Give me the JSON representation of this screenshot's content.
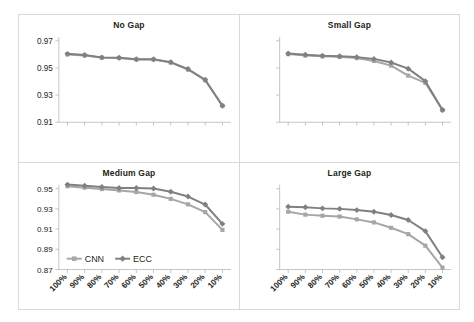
{
  "figure": {
    "background_color": "#ffffff",
    "border_color": "#d9d9d9"
  },
  "legend": {
    "position": "inside-bottom-left-of-medium-gap-panel",
    "entries": [
      {
        "label": "CNN",
        "color": "#a6a6a6",
        "marker": "square"
      },
      {
        "label": "ECC",
        "color": "#808080",
        "marker": "diamond"
      }
    ]
  },
  "axis": {
    "x_categories": [
      "100%",
      "90%",
      "80%",
      "70%",
      "60%",
      "50%",
      "40%",
      "30%",
      "20%",
      "10%"
    ],
    "x_label_rotation": -45,
    "top_y_ticks": [
      "0.91",
      "0.93",
      "0.95",
      "0.97"
    ],
    "bottom_y_ticks": [
      "0.87",
      "0.89",
      "0.91",
      "0.93",
      "0.95"
    ]
  },
  "chart_data": [
    {
      "type": "line",
      "title": "No Gap",
      "panel": "top-left",
      "xlabel": "",
      "ylabel": "",
      "categories": [
        "100%",
        "90%",
        "80%",
        "70%",
        "60%",
        "50%",
        "40%",
        "30%",
        "20%",
        "10%"
      ],
      "ylim": [
        0.91,
        0.97
      ],
      "yticks": [
        0.91,
        0.93,
        0.95,
        0.97
      ],
      "ytick_labels_visible": true,
      "grid": false,
      "series": [
        {
          "name": "CNN",
          "color": "#a6a6a6",
          "marker": "square",
          "values": [
            0.96,
            0.9592,
            0.9576,
            0.9574,
            0.9563,
            0.9562,
            0.954,
            0.9489,
            0.941,
            0.9222
          ]
        },
        {
          "name": "ECC",
          "color": "#808080",
          "marker": "diamond",
          "values": [
            0.9604,
            0.9595,
            0.9578,
            0.9576,
            0.9565,
            0.9564,
            0.9543,
            0.9492,
            0.9413,
            0.9222
          ]
        }
      ]
    },
    {
      "type": "line",
      "title": "Small Gap",
      "panel": "top-right",
      "xlabel": "",
      "ylabel": "",
      "categories": [
        "100%",
        "90%",
        "80%",
        "70%",
        "60%",
        "50%",
        "40%",
        "30%",
        "20%",
        "10%"
      ],
      "ylim": [
        0.91,
        0.97
      ],
      "yticks": [
        0.91,
        0.93,
        0.95,
        0.97
      ],
      "ytick_labels_visible": false,
      "grid": false,
      "series": [
        {
          "name": "CNN",
          "color": "#a6a6a6",
          "marker": "square",
          "values": [
            0.9602,
            0.9592,
            0.9586,
            0.9582,
            0.9573,
            0.9552,
            0.9517,
            0.9444,
            0.939,
            0.919
          ]
        },
        {
          "name": "ECC",
          "color": "#808080",
          "marker": "diamond",
          "values": [
            0.9607,
            0.9597,
            0.959,
            0.9586,
            0.958,
            0.9567,
            0.954,
            0.9495,
            0.9403,
            0.919
          ]
        }
      ]
    },
    {
      "type": "line",
      "title": "Medium Gap",
      "panel": "bottom-left",
      "xlabel": "",
      "ylabel": "",
      "categories": [
        "100%",
        "90%",
        "80%",
        "70%",
        "60%",
        "50%",
        "40%",
        "30%",
        "20%",
        "10%"
      ],
      "ylim": [
        0.87,
        0.95
      ],
      "yticks": [
        0.87,
        0.89,
        0.91,
        0.93,
        0.95
      ],
      "ytick_labels_visible": true,
      "grid": false,
      "series": [
        {
          "name": "CNN",
          "color": "#a6a6a6",
          "marker": "square",
          "values": [
            0.9524,
            0.951,
            0.9496,
            0.9482,
            0.9466,
            0.944,
            0.9399,
            0.9345,
            0.9268,
            0.9092
          ]
        },
        {
          "name": "ECC",
          "color": "#808080",
          "marker": "diamond",
          "values": [
            0.954,
            0.9528,
            0.9516,
            0.9506,
            0.9506,
            0.9502,
            0.947,
            0.9422,
            0.9343,
            0.9152
          ]
        }
      ]
    },
    {
      "type": "line",
      "title": "Large Gap",
      "panel": "bottom-right",
      "xlabel": "",
      "ylabel": "",
      "categories": [
        "100%",
        "90%",
        "80%",
        "70%",
        "60%",
        "50%",
        "40%",
        "30%",
        "20%",
        "10%"
      ],
      "ylim": [
        0.87,
        0.95
      ],
      "yticks": [
        0.87,
        0.89,
        0.91,
        0.93,
        0.95
      ],
      "ytick_labels_visible": false,
      "grid": false,
      "series": [
        {
          "name": "CNN",
          "color": "#a6a6a6",
          "marker": "square",
          "values": [
            0.9272,
            0.9243,
            0.9232,
            0.9224,
            0.9196,
            0.9166,
            0.9113,
            0.905,
            0.8936,
            0.8718
          ]
        },
        {
          "name": "ECC",
          "color": "#808080",
          "marker": "diamond",
          "values": [
            0.9322,
            0.9316,
            0.9305,
            0.93,
            0.9288,
            0.9272,
            0.924,
            0.919,
            0.908,
            0.8822
          ]
        }
      ]
    }
  ]
}
